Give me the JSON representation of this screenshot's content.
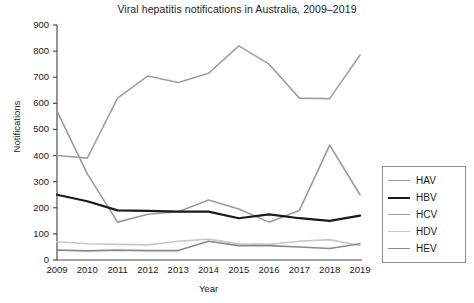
{
  "chart_data": {
    "type": "line",
    "title": "Viral hepatitis notifications in Australia, 2009–2019",
    "xlabel": "Year",
    "ylabel": "Notifications",
    "categories": [
      "2009",
      "2010",
      "2011",
      "2012",
      "2013",
      "2014",
      "2015",
      "2016",
      "2017",
      "2018",
      "2019"
    ],
    "x": [
      2009,
      2010,
      2011,
      2012,
      2013,
      2014,
      2015,
      2016,
      2017,
      2018,
      2019
    ],
    "xlim": [
      2009,
      2019
    ],
    "ylim": [
      0,
      900
    ],
    "yticks": [
      0,
      100,
      200,
      300,
      400,
      500,
      600,
      700,
      800,
      900
    ],
    "grid": false,
    "legend_position": "right",
    "series": [
      {
        "name": "HAV",
        "color": "#9a9a9a",
        "width": 1.6,
        "values": [
          570,
          330,
          145,
          175,
          185,
          230,
          195,
          145,
          190,
          440,
          250
        ]
      },
      {
        "name": "HBV",
        "color": "#1a1a1a",
        "width": 2.2,
        "values": [
          250,
          225,
          190,
          188,
          185,
          185,
          160,
          175,
          160,
          150,
          170
        ]
      },
      {
        "name": "HCV",
        "color": "#a0a0a0",
        "width": 1.6,
        "values": [
          400,
          390,
          620,
          705,
          680,
          715,
          820,
          750,
          620,
          618,
          785
        ]
      },
      {
        "name": "HDV",
        "color": "#c8c8c8",
        "width": 1.6,
        "values": [
          70,
          62,
          60,
          58,
          72,
          80,
          62,
          60,
          72,
          78,
          55
        ]
      },
      {
        "name": "HEV",
        "color": "#8a8a8a",
        "width": 1.6,
        "values": [
          38,
          35,
          38,
          36,
          36,
          72,
          55,
          55,
          50,
          44,
          62
        ]
      }
    ]
  },
  "legend": {
    "entries": [
      {
        "label": "HAV"
      },
      {
        "label": "HBV"
      },
      {
        "label": "HCV"
      },
      {
        "label": "HDV"
      },
      {
        "label": "HEV"
      }
    ]
  },
  "axes": {
    "y_tick_labels": [
      "900",
      "800",
      "700",
      "600",
      "500",
      "400",
      "300",
      "200",
      "100",
      "0"
    ],
    "x_tick_labels": [
      "2009",
      "2010",
      "2011",
      "2012",
      "2013",
      "2014",
      "2015",
      "2016",
      "2017",
      "2018",
      "2019"
    ]
  }
}
